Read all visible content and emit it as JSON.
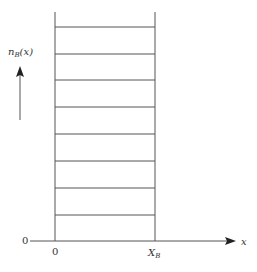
{
  "diagram": {
    "y_label_main": "n",
    "y_label_sub": "B",
    "y_label_tail": "(x)",
    "x_axis_label": "x",
    "origin_left_label": "0",
    "origin_bottom_label": "0",
    "xb_label_main": "X",
    "xb_label_sub": "B",
    "line_color": "#555555",
    "horizontal_levels": 8,
    "level_y_positions": [
      27,
      54,
      80,
      107,
      134,
      161,
      188,
      215
    ]
  }
}
